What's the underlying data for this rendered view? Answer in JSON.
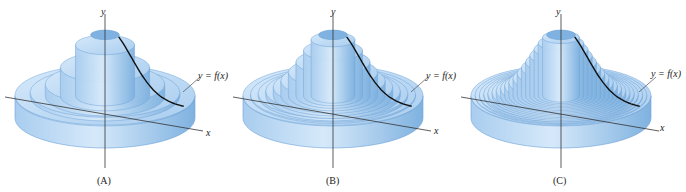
{
  "figure": {
    "panels": [
      {
        "id": "A",
        "caption": "(A)",
        "shell_count": 5,
        "y_axis_label": "y",
        "x_axis_label": "x",
        "curve_label": "y = f(x)"
      },
      {
        "id": "B",
        "caption": "(B)",
        "shell_count": 10,
        "y_axis_label": "y",
        "x_axis_label": "x",
        "curve_label": "y = f(x)"
      },
      {
        "id": "C",
        "caption": "(C)",
        "shell_count": 18,
        "y_axis_label": "y",
        "x_axis_label": "x",
        "curve_label": "y = f(x)"
      }
    ],
    "colors": {
      "solid_light": "#d6e9fa",
      "solid_mid": "#a9cdef",
      "solid_dark": "#7fb2e0",
      "edge": "#6fa3d6",
      "axis": "#333333",
      "curve": "#111111"
    }
  }
}
